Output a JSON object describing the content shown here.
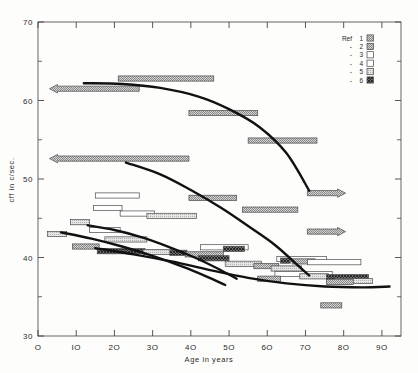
{
  "chart_data": {
    "type": "bar",
    "title": "",
    "xlabel": "Age in years",
    "ylabel": "cff in c/sec.",
    "xlim": [
      0,
      95
    ],
    "ylim": [
      30,
      70
    ],
    "xticks": [
      0,
      10,
      20,
      30,
      40,
      50,
      60,
      70,
      80,
      90
    ],
    "xticklabels": [
      "O",
      "IO",
      "2O",
      "3O",
      "4O",
      "5O",
      "6O",
      "7O",
      "8O",
      "9O"
    ],
    "yticks": [
      30,
      40,
      50,
      60,
      70
    ],
    "yticklabels": [
      "30",
      "40",
      "50",
      "60",
      "70"
    ],
    "yminorticks": [
      35,
      45,
      55,
      65
    ],
    "grid": false,
    "legend": {
      "position": "top-right",
      "title": "Ref",
      "entries": [
        {
          "label": "1",
          "prefix": "Ref",
          "pattern": "gray-dot-medium"
        },
        {
          "label": "2",
          "prefix": "-",
          "pattern": "gray-dot-medium"
        },
        {
          "label": "3",
          "prefix": "-",
          "pattern": "white-plain"
        },
        {
          "label": "4",
          "prefix": "-",
          "pattern": "white-plain"
        },
        {
          "label": "5",
          "prefix": "-",
          "pattern": "gray-light"
        },
        {
          "label": "6",
          "prefix": "-",
          "pattern": "dark-crosshatch"
        }
      ]
    },
    "bars": [
      {
        "x0": 21.0,
        "x1": 46.0,
        "y": 62.8,
        "pattern": "gray-dot-medium",
        "arrow": "none"
      },
      {
        "x0": 3.0,
        "x1": 26.5,
        "y": 61.5,
        "pattern": "gray-dot-medium",
        "arrow": "left"
      },
      {
        "x0": 39.5,
        "x1": 57.5,
        "y": 58.4,
        "pattern": "gray-dot-medium",
        "arrow": "none"
      },
      {
        "x0": 55.0,
        "x1": 73.0,
        "y": 54.9,
        "pattern": "gray-dot-medium",
        "arrow": "none"
      },
      {
        "x0": 3.0,
        "x1": 39.5,
        "y": 52.6,
        "pattern": "gray-dot-medium",
        "arrow": "left"
      },
      {
        "x0": 70.5,
        "x1": 80.5,
        "y": 48.2,
        "pattern": "gray-dot-medium",
        "arrow": "right"
      },
      {
        "x0": 15.0,
        "x1": 26.5,
        "y": 47.9,
        "pattern": "white-plain",
        "arrow": "none"
      },
      {
        "x0": 39.5,
        "x1": 52.0,
        "y": 47.6,
        "pattern": "gray-dot-medium",
        "arrow": "none"
      },
      {
        "x0": 14.5,
        "x1": 22.0,
        "y": 46.3,
        "pattern": "white-plain",
        "arrow": "none"
      },
      {
        "x0": 53.5,
        "x1": 68.0,
        "y": 46.1,
        "pattern": "gray-dot-medium",
        "arrow": "none"
      },
      {
        "x0": 21.5,
        "x1": 30.5,
        "y": 45.6,
        "pattern": "white-plain",
        "arrow": "none"
      },
      {
        "x0": 28.5,
        "x1": 41.5,
        "y": 45.3,
        "pattern": "gray-light",
        "arrow": "none"
      },
      {
        "x0": 8.5,
        "x1": 13.5,
        "y": 44.5,
        "pattern": "gray-light",
        "arrow": "none"
      },
      {
        "x0": 70.5,
        "x1": 80.5,
        "y": 43.3,
        "pattern": "gray-dot-medium",
        "arrow": "right"
      },
      {
        "x0": 13.5,
        "x1": 21.5,
        "y": 43.5,
        "pattern": "white-plain",
        "arrow": "none"
      },
      {
        "x0": 2.5,
        "x1": 7.5,
        "y": 43.0,
        "pattern": "gray-light",
        "arrow": "none"
      },
      {
        "x0": 17.5,
        "x1": 28.5,
        "y": 42.3,
        "pattern": "gray-light",
        "arrow": "none"
      },
      {
        "x0": 9.0,
        "x1": 16.0,
        "y": 41.4,
        "pattern": "gray-dot-medium",
        "arrow": "none"
      },
      {
        "x0": 42.5,
        "x1": 55.0,
        "y": 41.3,
        "pattern": "white-plain",
        "arrow": "none"
      },
      {
        "x0": 48.5,
        "x1": 54.0,
        "y": 41.1,
        "pattern": "dark-crosshatch",
        "arrow": "none"
      },
      {
        "x0": 15.5,
        "x1": 28.0,
        "y": 40.8,
        "pattern": "dark-crosshatch",
        "arrow": "none"
      },
      {
        "x0": 27.5,
        "x1": 35.0,
        "y": 40.7,
        "pattern": "gray-light",
        "arrow": "none"
      },
      {
        "x0": 34.5,
        "x1": 39.0,
        "y": 40.6,
        "pattern": "dark-crosshatch",
        "arrow": "none"
      },
      {
        "x0": 38.5,
        "x1": 48.5,
        "y": 40.4,
        "pattern": "gray-dot-medium",
        "arrow": "none"
      },
      {
        "x0": 42.0,
        "x1": 50.0,
        "y": 39.9,
        "pattern": "dark-crosshatch",
        "arrow": "none"
      },
      {
        "x0": 62.5,
        "x1": 75.5,
        "y": 39.8,
        "pattern": "white-plain",
        "arrow": "none"
      },
      {
        "x0": 63.5,
        "x1": 66.0,
        "y": 39.6,
        "pattern": "dark-crosshatch",
        "arrow": "none"
      },
      {
        "x0": 66.5,
        "x1": 72.5,
        "y": 39.5,
        "pattern": "gray-dot-medium",
        "arrow": "none"
      },
      {
        "x0": 70.5,
        "x1": 84.5,
        "y": 39.4,
        "pattern": "white-plain",
        "arrow": "none"
      },
      {
        "x0": 49.0,
        "x1": 58.5,
        "y": 39.2,
        "pattern": "gray-light",
        "arrow": "none"
      },
      {
        "x0": 56.5,
        "x1": 63.0,
        "y": 38.9,
        "pattern": "gray-dot-medium",
        "arrow": "none"
      },
      {
        "x0": 61.0,
        "x1": 69.0,
        "y": 38.6,
        "pattern": "gray-light",
        "arrow": "none"
      },
      {
        "x0": 62.0,
        "x1": 77.0,
        "y": 37.9,
        "pattern": "white-plain",
        "arrow": "none"
      },
      {
        "x0": 68.5,
        "x1": 76.0,
        "y": 37.6,
        "pattern": "gray-light",
        "arrow": "none"
      },
      {
        "x0": 75.5,
        "x1": 86.5,
        "y": 37.5,
        "pattern": "dark-crosshatch",
        "arrow": "none"
      },
      {
        "x0": 57.5,
        "x1": 63.5,
        "y": 37.3,
        "pattern": "gray-dot-medium",
        "arrow": "none"
      },
      {
        "x0": 77.5,
        "x1": 87.5,
        "y": 37.0,
        "pattern": "gray-light",
        "arrow": "none"
      },
      {
        "x0": 75.5,
        "x1": 82.5,
        "y": 36.9,
        "pattern": "gray-dot-medium",
        "arrow": "none"
      },
      {
        "x0": 74.0,
        "x1": 79.5,
        "y": 33.9,
        "pattern": "gray-dot-medium",
        "arrow": "none"
      }
    ],
    "curves": [
      {
        "name": "curve-1",
        "points": [
          [
            12,
            62.2
          ],
          [
            22,
            62.1
          ],
          [
            32,
            61.6
          ],
          [
            42,
            60.5
          ],
          [
            50,
            58.9
          ],
          [
            58,
            56.6
          ],
          [
            65,
            53.3
          ],
          [
            71,
            48.5
          ]
        ]
      },
      {
        "name": "curve-2",
        "points": [
          [
            23,
            52.1
          ],
          [
            32,
            50.6
          ],
          [
            40,
            48.6
          ],
          [
            48,
            46.3
          ],
          [
            55,
            44.0
          ],
          [
            62,
            41.6
          ],
          [
            68,
            39.0
          ],
          [
            71,
            37.7
          ]
        ]
      },
      {
        "name": "curve-3",
        "points": [
          [
            13,
            44.1
          ],
          [
            20,
            43.5
          ],
          [
            27,
            42.6
          ],
          [
            34,
            41.4
          ],
          [
            41,
            40.0
          ],
          [
            47,
            38.6
          ],
          [
            52,
            37.3
          ]
        ]
      },
      {
        "name": "curve-4",
        "points": [
          [
            6,
            43.2
          ],
          [
            14,
            42.4
          ],
          [
            22,
            41.4
          ],
          [
            30,
            40.2
          ],
          [
            38,
            38.8
          ],
          [
            44,
            37.6
          ],
          [
            49,
            36.5
          ]
        ]
      },
      {
        "name": "curve-5",
        "points": [
          [
            15,
            41.2
          ],
          [
            25,
            40.4
          ],
          [
            35,
            39.5
          ],
          [
            45,
            38.4
          ],
          [
            55,
            37.4
          ],
          [
            65,
            36.7
          ],
          [
            75,
            36.3
          ],
          [
            85,
            36.2
          ],
          [
            92,
            36.3
          ]
        ]
      }
    ]
  }
}
